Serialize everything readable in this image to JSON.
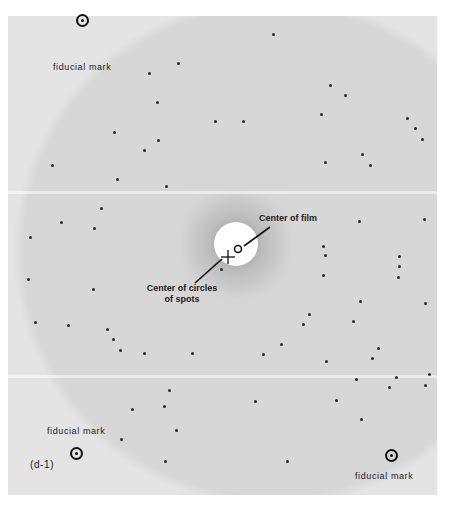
{
  "figure": {
    "panel_label": "(d-1)",
    "colors": {
      "film": "#e4e4e4",
      "spot": "#2a2a2a",
      "ink": "#111111",
      "halo": "#ffffff"
    }
  },
  "labels": {
    "fiducial_top_left": "fiducial mark",
    "fiducial_bottom_left": "fiducial mark",
    "fiducial_bottom_right": "fiducial mark",
    "center_of_film": "Center of film",
    "center_of_circles_line1": "Center of circles",
    "center_of_circles_line2": "of spots"
  },
  "fiducials": [
    {
      "name": "top-left",
      "x": 82,
      "y": 20
    },
    {
      "name": "bottom-left",
      "x": 76,
      "y": 453
    },
    {
      "name": "bottom-right",
      "x": 391,
      "y": 455
    }
  ],
  "markers": {
    "film_center": {
      "x": 238,
      "y": 249
    },
    "circles_center": {
      "x": 228,
      "y": 257
    },
    "halo": {
      "x": 236,
      "y": 244,
      "r": 22
    }
  },
  "spots": [
    [
      273,
      34
    ],
    [
      178,
      63
    ],
    [
      149,
      73
    ],
    [
      157,
      102
    ],
    [
      215,
      121
    ],
    [
      243,
      121
    ],
    [
      330,
      85
    ],
    [
      345,
      95
    ],
    [
      321,
      114
    ],
    [
      407,
      118
    ],
    [
      415,
      128
    ],
    [
      422,
      139
    ],
    [
      362,
      154
    ],
    [
      370,
      165
    ],
    [
      325,
      162
    ],
    [
      114,
      132
    ],
    [
      158,
      140
    ],
    [
      144,
      150
    ],
    [
      52,
      165
    ],
    [
      117,
      179
    ],
    [
      166,
      186
    ],
    [
      101,
      208
    ],
    [
      61,
      222
    ],
    [
      94,
      228
    ],
    [
      30,
      237
    ],
    [
      359,
      221
    ],
    [
      424,
      219
    ],
    [
      323,
      246
    ],
    [
      325,
      255
    ],
    [
      323,
      275
    ],
    [
      399,
      256
    ],
    [
      399,
      266
    ],
    [
      398,
      277
    ],
    [
      360,
      301
    ],
    [
      425,
      303
    ],
    [
      309,
      314
    ],
    [
      353,
      321
    ],
    [
      303,
      324
    ],
    [
      378,
      348
    ],
    [
      28,
      279
    ],
    [
      93,
      289
    ],
    [
      35,
      322
    ],
    [
      68,
      325
    ],
    [
      107,
      329
    ],
    [
      113,
      339
    ],
    [
      120,
      350
    ],
    [
      144,
      353
    ],
    [
      192,
      353
    ],
    [
      169,
      390
    ],
    [
      164,
      406
    ],
    [
      132,
      409
    ],
    [
      221,
      269
    ],
    [
      281,
      344
    ],
    [
      263,
      354
    ],
    [
      372,
      358
    ],
    [
      326,
      361
    ],
    [
      356,
      379
    ],
    [
      396,
      377
    ],
    [
      429,
      374
    ],
    [
      425,
      385
    ],
    [
      389,
      387
    ],
    [
      255,
      401
    ],
    [
      336,
      400
    ],
    [
      361,
      419
    ],
    [
      287,
      461
    ],
    [
      176,
      430
    ],
    [
      121,
      439
    ],
    [
      165,
      461
    ]
  ]
}
